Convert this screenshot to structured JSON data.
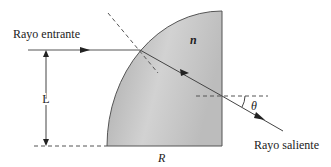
{
  "diagram": {
    "type": "optics-refraction",
    "labels": {
      "incoming_ray": "Rayo entrante",
      "outgoing_ray": "Rayo saliente",
      "refractive_index": "n",
      "height": "L",
      "radius": "R",
      "angle": "θ"
    },
    "colors": {
      "lens_fill_light": "#d8d8d8",
      "lens_fill_dark": "#a8a8a8",
      "lens_edge": "#555555",
      "ray": "#333333",
      "dashed": "#555555",
      "text": "#222222"
    }
  }
}
